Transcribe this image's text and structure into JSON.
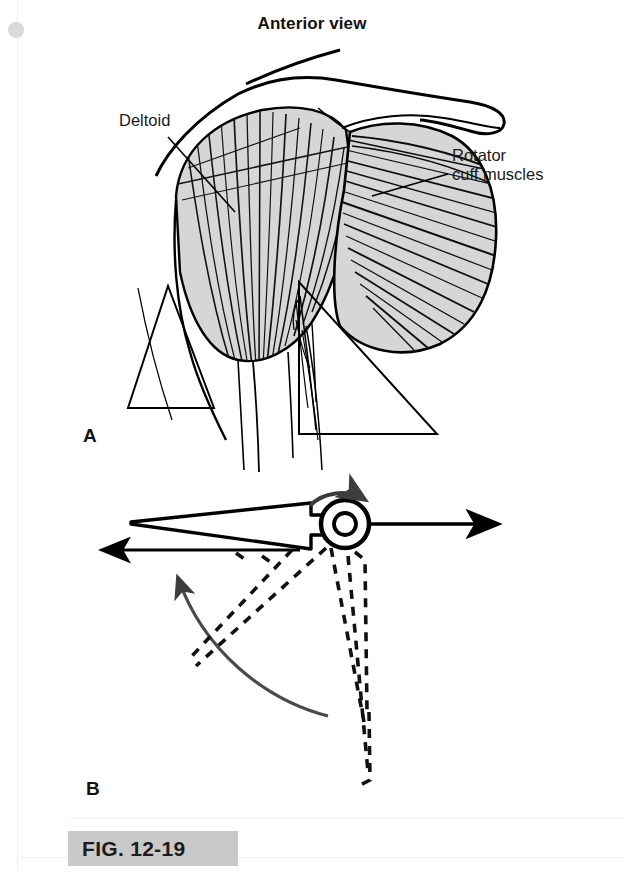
{
  "page": {
    "title": "Anterior view",
    "background_color": "#ffffff",
    "width": 624,
    "height": 872
  },
  "figure": {
    "caption_label": "FIG. 12-19",
    "caption_chip_color": "#c9c9c9"
  },
  "panels": [
    {
      "letter": "A",
      "type": "anatomical-illustration",
      "description": "Anterior view of shoulder showing deltoid and rotator cuff muscles"
    },
    {
      "letter": "B",
      "type": "biomechanical-diagram",
      "description": "Force-couple diagram of humerus with joint, translation arrows and rotation arc"
    }
  ],
  "panel_a": {
    "letter": "A",
    "labels": [
      {
        "name": "deltoid",
        "text": "Deltoid"
      },
      {
        "name": "rotator-cuff",
        "text": "Rotator\ncuff muscles"
      }
    ],
    "muscle_fill": "#d6d6d6",
    "outline_color": "#000000"
  },
  "panel_b": {
    "letter": "B",
    "arrows": [
      {
        "name": "superior-translation-arrow",
        "direction": "right"
      },
      {
        "name": "medial-translation-arrow",
        "direction": "left"
      },
      {
        "name": "rotation-arrow-joint",
        "direction": "clockwise"
      },
      {
        "name": "abduction-arc-arrow",
        "direction": "counter-clockwise-up"
      }
    ],
    "dashed_position_name": "resting-arm-position",
    "outline_color": "#000000"
  },
  "icons": {
    "scan_dot": "hole-punch-icon",
    "binding_line": "page-binding-line"
  }
}
